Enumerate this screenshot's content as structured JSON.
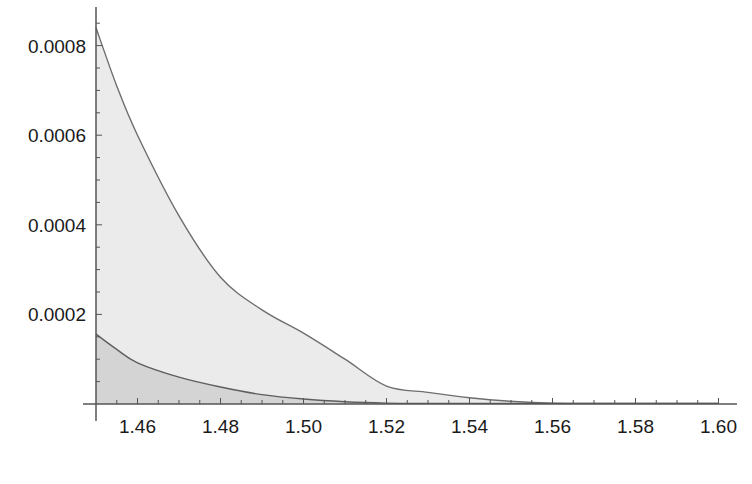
{
  "chart_data": {
    "type": "area",
    "title": "",
    "xlabel": "",
    "ylabel": "",
    "xlim": [
      1.45,
      1.6
    ],
    "ylim": [
      0,
      0.00085
    ],
    "grid": false,
    "legend": null,
    "x_ticks": [
      "1.46",
      "1.48",
      "1.50",
      "1.52",
      "1.54",
      "1.56",
      "1.58",
      "1.60"
    ],
    "x_tick_values": [
      1.46,
      1.48,
      1.5,
      1.52,
      1.54,
      1.56,
      1.58,
      1.6
    ],
    "y_ticks": [
      "0.0002",
      "0.0004",
      "0.0006",
      "0.0008"
    ],
    "y_tick_values": [
      0.0002,
      0.0004,
      0.0006,
      0.0008
    ],
    "x": [
      1.45,
      1.455,
      1.46,
      1.47,
      1.48,
      1.49,
      1.5,
      1.51,
      1.52,
      1.53,
      1.54,
      1.55,
      1.56,
      1.58,
      1.6
    ],
    "series": [
      {
        "name": "upper-curve",
        "fill": "#ebebeb",
        "line": "#6e6e6e",
        "values": [
          0.00084,
          0.00071,
          0.0006,
          0.00042,
          0.000283,
          0.00021,
          0.000158,
          0.0001,
          4e-05,
          2.6e-05,
          1.4e-05,
          6e-06,
          2e-06,
          1e-06,
          1e-06
        ]
      },
      {
        "name": "lower-curve",
        "fill": "#d4d4d4",
        "line": "#5e5e5e",
        "values": [
          0.000156,
          0.000122,
          9.2e-05,
          6e-05,
          3.8e-05,
          2.1e-05,
          1.1e-05,
          5e-06,
          2e-06,
          1e-06,
          0.0,
          0.0,
          0.0,
          0.0,
          0.0
        ]
      }
    ]
  },
  "caption": {
    "visible": "clipped"
  },
  "colors": {
    "axis": "#555555",
    "upper_fill": "#ebebeb",
    "lower_fill": "#d4d4d4",
    "curve_line": "#6e6e6e"
  }
}
